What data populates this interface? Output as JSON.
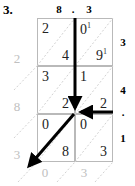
{
  "problem": {
    "number": "3."
  },
  "colors": {
    "grid_line": "#b9b9b9",
    "diagonal": "#d0d0d0",
    "arrow": "#000000",
    "gray_digit": "#c0c0c0",
    "label": "#000000"
  },
  "multiplicand": {
    "digits": [
      "8",
      "3"
    ],
    "decimal_point": ".",
    "top_labels": [
      "8",
      ".",
      "3"
    ]
  },
  "multiplier": {
    "digits": [
      "3",
      "4",
      "1"
    ],
    "decimal_point": ".",
    "side_labels": [
      "3",
      "4",
      ".",
      "1"
    ]
  },
  "lattice": {
    "rows": 3,
    "cols": 2,
    "cells": [
      [
        {
          "upper": "2",
          "lower": "4",
          "upper_carry": "",
          "lower_carry": ""
        },
        {
          "upper": "0",
          "lower": "9",
          "upper_carry": "1",
          "lower_carry": "1"
        }
      ],
      [
        {
          "upper": "3",
          "lower": "2",
          "upper_carry": "",
          "lower_carry": ""
        },
        {
          "upper": "1",
          "lower": "2",
          "upper_carry": "",
          "lower_carry": ""
        }
      ],
      [
        {
          "upper": "0",
          "lower": "8",
          "upper_carry": "",
          "lower_carry": ""
        },
        {
          "upper": "0",
          "lower": "3",
          "upper_carry": "",
          "lower_carry": ""
        }
      ]
    ]
  },
  "result": {
    "left_digits": [
      "2",
      "8",
      "3"
    ],
    "bottom_digits": [
      "0",
      "3"
    ],
    "reading": "2 8 3 0 3"
  },
  "annotations": {
    "arrow_down_label": "down-arrow-column-sum",
    "arrow_left_label": "left-arrow-row-sum",
    "arrow_diagonal_label": "diagonal-arrow-carry"
  }
}
